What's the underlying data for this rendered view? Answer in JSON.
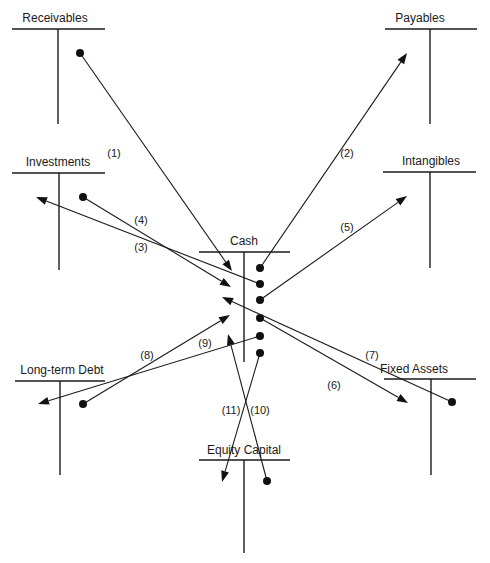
{
  "diagram": {
    "accounts": [
      {
        "id": "receivables",
        "label": "Receivables",
        "lx": 55,
        "ly": 22,
        "x1": 12,
        "x2": 105,
        "y": 29,
        "vx": 58,
        "vy2": 124
      },
      {
        "id": "payables",
        "label": "Payables",
        "lx": 420,
        "ly": 22,
        "x1": 385,
        "x2": 477,
        "y": 29,
        "vx": 430,
        "vy2": 124
      },
      {
        "id": "investments",
        "label": "Investments",
        "lx": 58,
        "ly": 166,
        "x1": 12,
        "x2": 105,
        "y": 173,
        "vx": 59,
        "vy2": 270
      },
      {
        "id": "intangibles",
        "label": "Intangibles",
        "lx": 431,
        "ly": 165,
        "x1": 383,
        "x2": 476,
        "y": 172,
        "vx": 430,
        "vy2": 268
      },
      {
        "id": "cash",
        "label": "Cash",
        "lx": 244,
        "ly": 245,
        "x1": 199,
        "x2": 290,
        "y": 252,
        "vx": 244,
        "vy2": 362
      },
      {
        "id": "long-term-debt",
        "label": "Long-term Debt",
        "lx": 62,
        "ly": 374,
        "x1": 15,
        "x2": 105,
        "y": 381,
        "vx": 60,
        "vy2": 475
      },
      {
        "id": "fixed-assets",
        "label": "Fixed Assets",
        "lx": 414,
        "ly": 373,
        "x1": 384,
        "x2": 476,
        "y": 379,
        "vx": 431,
        "vy2": 475
      },
      {
        "id": "equity-capital",
        "label": "Equity Capital",
        "lx": 244,
        "ly": 454,
        "x1": 199,
        "x2": 290,
        "y": 460,
        "vx": 244,
        "vy2": 553
      }
    ],
    "flows": [
      {
        "num": "(1)",
        "from": "Receivables",
        "to": "Cash",
        "sx": 80,
        "sy": 53,
        "ex": 232,
        "ey": 271,
        "tx": 114,
        "ty": 157
      },
      {
        "num": "(2)",
        "from": "Cash",
        "to": "Payables",
        "sx": 260,
        "sy": 268,
        "ex": 407,
        "ey": 53,
        "tx": 347,
        "ty": 157
      },
      {
        "num": "(3)",
        "from": "Cash",
        "to": "Investments",
        "sx": 260,
        "sy": 284,
        "ex": 36,
        "ey": 197,
        "tx": 141,
        "ty": 251
      },
      {
        "num": "(4)",
        "from": "Investments",
        "to": "Cash",
        "sx": 83,
        "sy": 197,
        "ex": 231,
        "ey": 287,
        "tx": 141,
        "ty": 224
      },
      {
        "num": "(5)",
        "from": "Cash",
        "to": "Intangibles",
        "sx": 260,
        "sy": 300,
        "ex": 407,
        "ey": 196,
        "tx": 347,
        "ty": 231
      },
      {
        "num": "(6)",
        "from": "Cash",
        "to": "Fixed Assets",
        "sx": 260,
        "sy": 318,
        "ex": 408,
        "ey": 403,
        "tx": 334,
        "ty": 389
      },
      {
        "num": "(7)",
        "from": "Fixed Assets",
        "to": "Cash",
        "sx": 452,
        "sy": 402,
        "ex": 222,
        "ey": 297,
        "tx": 372,
        "ty": 359
      },
      {
        "num": "(8)",
        "from": "Long-term Debt",
        "to": "Cash",
        "sx": 83,
        "sy": 404,
        "ex": 230,
        "ey": 315,
        "tx": 147,
        "ty": 359
      },
      {
        "num": "(9)",
        "from": "Cash",
        "to": "Long-term Debt",
        "sx": 260,
        "sy": 336,
        "ex": 38,
        "ey": 404,
        "tx": 205,
        "ty": 347
      },
      {
        "num": "(10)",
        "from": "Equity Capital",
        "to": "Cash",
        "sx": 267,
        "sy": 481,
        "ex": 228,
        "ey": 334,
        "tx": 260,
        "ty": 414
      },
      {
        "num": "(11)",
        "from": "Cash",
        "to": "Equity Capital",
        "sx": 260,
        "sy": 353,
        "ex": 222,
        "ey": 482,
        "tx": 231,
        "ty": 414
      }
    ],
    "colors": {
      "ink": "#1a1a1a",
      "background": "#ffffff"
    }
  }
}
